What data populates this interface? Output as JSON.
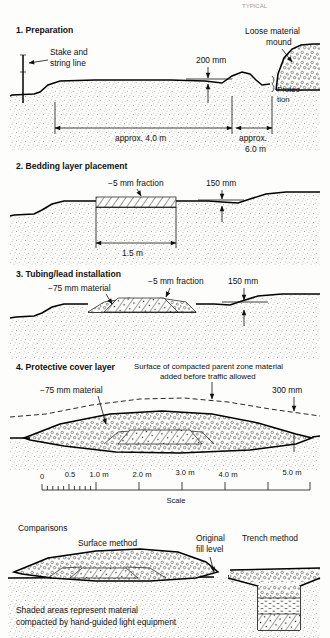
{
  "page": {
    "header_faint": "TYPICAL",
    "width": 330,
    "height": 638,
    "background": "#fdfdfb",
    "ink": "#111111"
  },
  "sections": [
    {
      "id": "preparation",
      "heading": "1. Preparation",
      "labels": {
        "stake": "Stake and\nstring line",
        "stake_line1": "Stake and",
        "stake_line2": "string line",
        "mound_line1": "Loose material",
        "mound_line2": "mound",
        "protection_line1": "Protec-",
        "protection_line2": "tion",
        "depth": "200 mm",
        "span_left": "approx. 4.0 m",
        "span_right_line1": "approx.",
        "span_right_line2": "6.0 m"
      }
    },
    {
      "id": "bedding",
      "heading": "2. Bedding layer placement",
      "labels": {
        "fraction": "−5 mm fraction",
        "depth": "150 mm",
        "width": "1.5 m"
      }
    },
    {
      "id": "tubing",
      "heading": "3. Tubing/lead installation",
      "labels": {
        "material": "−75 mm material",
        "fraction": "−5 mm fraction",
        "depth": "150 mm"
      }
    },
    {
      "id": "cover",
      "heading": "4. Protective cover layer",
      "labels": {
        "material": "−75 mm material",
        "surface_line1": "Surface of compacted parent zone material",
        "surface_line2": "added before traffic allowed",
        "depth": "300 mm"
      }
    }
  ],
  "scale": {
    "caption": "Scale",
    "ticks": [
      {
        "label": "0",
        "value": 0
      },
      {
        "label": "0.5",
        "value": 0.5
      },
      {
        "label": "1.0 m",
        "value": 1.0
      },
      {
        "label": "2.0 m",
        "value": 2.0
      },
      {
        "label": "3.0 m",
        "value": 3.0
      },
      {
        "label": "4.0 m",
        "value": 4.0
      },
      {
        "label": "5.0 m",
        "value": 5.0
      }
    ],
    "minor_subdivisions": 10,
    "minor_range_m": 1.0
  },
  "comparisons": {
    "heading": "Comparisons",
    "surface_method": "Surface method",
    "trench_method": "Trench method",
    "original_fill_line1": "Original",
    "original_fill_line2": "fill level",
    "note_line1": "Shaded areas represent material",
    "note_line2": "compacted by hand-guided light equipment"
  }
}
